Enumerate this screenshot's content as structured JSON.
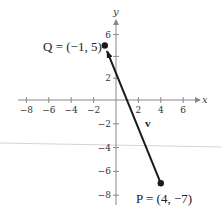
{
  "diagram": {
    "type": "coordinate-plane-vector",
    "axes": {
      "x_label": "x",
      "y_label": "y",
      "x_ticks": [
        {
          "value": -8,
          "label": "−8"
        },
        {
          "value": -6,
          "label": "−6"
        },
        {
          "value": -4,
          "label": "−4"
        },
        {
          "value": -2,
          "label": "−2"
        },
        {
          "value": 2,
          "label": "2"
        },
        {
          "value": 4,
          "label": "4"
        },
        {
          "value": 6,
          "label": "6"
        }
      ],
      "y_ticks": [
        {
          "value": 6,
          "label": "6"
        },
        {
          "value": 4,
          "label": ""
        },
        {
          "value": 2,
          "label": "2"
        },
        {
          "value": -2,
          "label": "−2"
        },
        {
          "value": -4,
          "label": "−4"
        },
        {
          "value": -6,
          "label": "−6"
        },
        {
          "value": -8,
          "label": "−8"
        }
      ]
    },
    "points": {
      "Q": {
        "name": "Q",
        "x": -1,
        "y": 5,
        "label": "Q = (−1, 5)"
      },
      "P": {
        "name": "P",
        "x": 4,
        "y": -7,
        "label": "P = (4, −7)"
      }
    },
    "vector": {
      "name": "v",
      "label": "v",
      "from": "P",
      "to": "Q"
    },
    "colors": {
      "axis": "#888888",
      "vector": "#1a1a1a",
      "artifact_line": "#d0d0d0"
    }
  }
}
